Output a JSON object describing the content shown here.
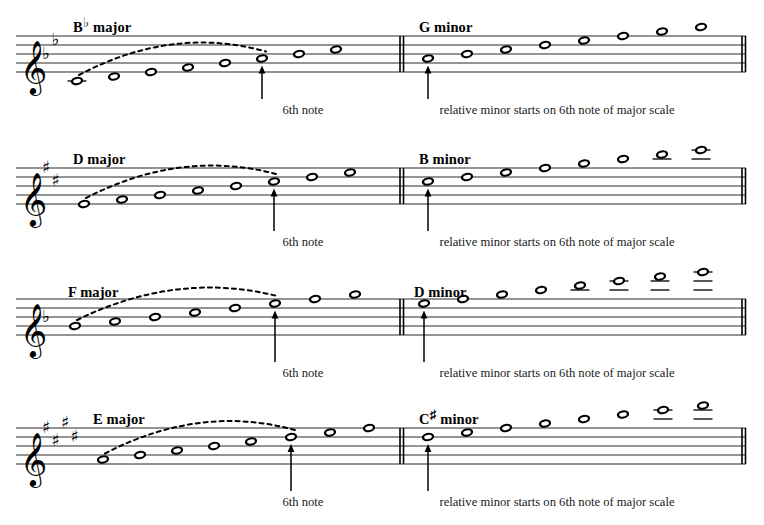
{
  "document": {
    "title": "Relative minor scales derived from major scales",
    "clef": "treble-clef",
    "note_head_type": "whole-note",
    "colors": {
      "ink": "#000000",
      "staff_line": "#2b2b2b",
      "slur": "#000000",
      "text": "#000000"
    }
  },
  "systems": [
    {
      "id": "system-1",
      "staff_top": 36,
      "major": {
        "label_text": "B",
        "label_accidental": "♭",
        "label_suffix": " major",
        "label_x": 73,
        "label_y": 20,
        "key_signature": {
          "type": "flat",
          "count": 2,
          "glyphs": [
            "♭",
            "♭"
          ]
        },
        "arrow_label": "6th note",
        "arrow_label_x": 303,
        "arrow_note_index": 5,
        "slur_from_index": 0,
        "slur_to_index": 5,
        "notes": [
          {
            "step": "B♭",
            "x": 77,
            "staff_pos": -2,
            "ledger": true
          },
          {
            "step": "C",
            "x": 114,
            "staff_pos": -1,
            "ledger": false
          },
          {
            "step": "D",
            "x": 151,
            "staff_pos": 0,
            "ledger": false
          },
          {
            "step": "E♭",
            "x": 188,
            "staff_pos": 1,
            "ledger": false
          },
          {
            "step": "F",
            "x": 225,
            "staff_pos": 2,
            "ledger": false
          },
          {
            "step": "G",
            "x": 262,
            "staff_pos": 3,
            "ledger": false
          },
          {
            "step": "A",
            "x": 299,
            "staff_pos": 4,
            "ledger": false
          },
          {
            "step": "B♭",
            "x": 336,
            "staff_pos": 5,
            "ledger": false
          }
        ]
      },
      "minor": {
        "label_text": "G",
        "label_accidental": "",
        "label_suffix": " minor",
        "label_x": 419,
        "label_y": 20,
        "key_signature": {
          "type": "none",
          "count": 0,
          "glyphs": []
        },
        "arrow_label": "relative minor starts on 6th note of major scale",
        "arrow_label_x": 557,
        "arrow_note_index": 0,
        "barline_x": 400,
        "end_barline_x": 742,
        "notes": [
          {
            "step": "G",
            "x": 428,
            "staff_pos": 3,
            "ledger": false
          },
          {
            "step": "A",
            "x": 467,
            "staff_pos": 4,
            "ledger": false
          },
          {
            "step": "B♭",
            "x": 506,
            "staff_pos": 5,
            "ledger": false
          },
          {
            "step": "C",
            "x": 545,
            "staff_pos": 6,
            "ledger": false
          },
          {
            "step": "D",
            "x": 584,
            "staff_pos": 7,
            "ledger": false
          },
          {
            "step": "E♭",
            "x": 623,
            "staff_pos": 8,
            "ledger": false
          },
          {
            "step": "F",
            "x": 662,
            "staff_pos": 9,
            "ledger": false
          },
          {
            "step": "G",
            "x": 701,
            "staff_pos": 10,
            "ledger": false
          }
        ]
      }
    },
    {
      "id": "system-2",
      "staff_top": 168,
      "major": {
        "label_text": "D",
        "label_accidental": "",
        "label_suffix": " major",
        "label_x": 73,
        "label_y": 152,
        "key_signature": {
          "type": "sharp",
          "count": 2,
          "glyphs": [
            "♯",
            "♯"
          ]
        },
        "arrow_label": "6th note",
        "arrow_label_x": 303,
        "arrow_note_index": 5,
        "slur_from_index": 0,
        "slur_to_index": 5,
        "notes": [
          {
            "step": "D",
            "x": 84,
            "staff_pos": 0,
            "ledger": false
          },
          {
            "step": "E",
            "x": 122,
            "staff_pos": 1,
            "ledger": false
          },
          {
            "step": "F♯",
            "x": 160,
            "staff_pos": 2,
            "ledger": false
          },
          {
            "step": "G",
            "x": 198,
            "staff_pos": 3,
            "ledger": false
          },
          {
            "step": "A",
            "x": 236,
            "staff_pos": 4,
            "ledger": false
          },
          {
            "step": "B",
            "x": 274,
            "staff_pos": 5,
            "ledger": false
          },
          {
            "step": "C♯",
            "x": 312,
            "staff_pos": 6,
            "ledger": false
          },
          {
            "step": "D",
            "x": 350,
            "staff_pos": 7,
            "ledger": false
          }
        ]
      },
      "minor": {
        "label_text": "B",
        "label_accidental": "",
        "label_suffix": " minor",
        "label_x": 419,
        "label_y": 152,
        "key_signature": {
          "type": "none",
          "count": 0,
          "glyphs": []
        },
        "arrow_label": "relative minor starts on 6th note of major scale",
        "arrow_label_x": 557,
        "arrow_note_index": 0,
        "barline_x": 400,
        "end_barline_x": 742,
        "notes": [
          {
            "step": "B",
            "x": 428,
            "staff_pos": 5,
            "ledger": false
          },
          {
            "step": "C♯",
            "x": 467,
            "staff_pos": 6,
            "ledger": false
          },
          {
            "step": "D",
            "x": 506,
            "staff_pos": 7,
            "ledger": false
          },
          {
            "step": "E",
            "x": 545,
            "staff_pos": 8,
            "ledger": false
          },
          {
            "step": "F♯",
            "x": 584,
            "staff_pos": 9,
            "ledger": false
          },
          {
            "step": "G",
            "x": 623,
            "staff_pos": 10,
            "ledger": false
          },
          {
            "step": "A",
            "x": 662,
            "staff_pos": 11,
            "ledger": true
          },
          {
            "step": "B",
            "x": 701,
            "staff_pos": 12,
            "ledger": true
          }
        ]
      }
    },
    {
      "id": "system-3",
      "staff_top": 299,
      "major": {
        "label_text": "F",
        "label_accidental": "",
        "label_suffix": " major",
        "label_x": 68,
        "label_y": 285,
        "key_signature": {
          "type": "flat",
          "count": 1,
          "glyphs": [
            "♭"
          ]
        },
        "arrow_label": "6th note",
        "arrow_label_x": 303,
        "arrow_note_index": 5,
        "slur_from_index": 0,
        "slur_to_index": 5,
        "notes": [
          {
            "step": "F",
            "x": 75,
            "staff_pos": 2,
            "ledger": false
          },
          {
            "step": "G",
            "x": 115,
            "staff_pos": 3,
            "ledger": false
          },
          {
            "step": "A",
            "x": 155,
            "staff_pos": 4,
            "ledger": false
          },
          {
            "step": "B♭",
            "x": 195,
            "staff_pos": 5,
            "ledger": false
          },
          {
            "step": "C",
            "x": 235,
            "staff_pos": 6,
            "ledger": false
          },
          {
            "step": "D",
            "x": 275,
            "staff_pos": 7,
            "ledger": false
          },
          {
            "step": "E",
            "x": 315,
            "staff_pos": 8,
            "ledger": false
          },
          {
            "step": "F",
            "x": 355,
            "staff_pos": 9,
            "ledger": false
          }
        ]
      },
      "minor": {
        "label_text": "D",
        "label_accidental": "",
        "label_suffix": " minor",
        "label_x": 414,
        "label_y": 285,
        "key_signature": {
          "type": "none",
          "count": 0,
          "glyphs": []
        },
        "arrow_label": "relative minor starts on 6th note of major scale",
        "arrow_label_x": 557,
        "arrow_note_index": 0,
        "barline_x": 400,
        "end_barline_x": 742,
        "notes": [
          {
            "step": "D",
            "x": 424,
            "staff_pos": 7,
            "ledger": false
          },
          {
            "step": "E",
            "x": 463,
            "staff_pos": 8,
            "ledger": false
          },
          {
            "step": "F",
            "x": 502,
            "staff_pos": 9,
            "ledger": false
          },
          {
            "step": "G",
            "x": 541,
            "staff_pos": 10,
            "ledger": false
          },
          {
            "step": "A",
            "x": 580,
            "staff_pos": 11,
            "ledger": true
          },
          {
            "step": "B♭",
            "x": 619,
            "staff_pos": 12,
            "ledger": true
          },
          {
            "step": "C",
            "x": 660,
            "staff_pos": 13,
            "ledger": true
          },
          {
            "step": "D",
            "x": 703,
            "staff_pos": 14,
            "ledger": true
          }
        ]
      }
    },
    {
      "id": "system-4",
      "staff_top": 428,
      "major": {
        "label_text": "E",
        "label_accidental": "",
        "label_suffix": " major",
        "label_x": 93,
        "label_y": 412,
        "key_signature": {
          "type": "sharp",
          "count": 4,
          "glyphs": [
            "♯",
            "♯",
            "♯",
            "♯"
          ]
        },
        "arrow_label": "6th note",
        "arrow_label_x": 303,
        "arrow_note_index": 5,
        "slur_from_index": 0,
        "slur_to_index": 5,
        "notes": [
          {
            "step": "E",
            "x": 103,
            "staff_pos": 1,
            "ledger": false
          },
          {
            "step": "F♯",
            "x": 140,
            "staff_pos": 2,
            "ledger": false
          },
          {
            "step": "G♯",
            "x": 177,
            "staff_pos": 3,
            "ledger": false
          },
          {
            "step": "A",
            "x": 214,
            "staff_pos": 4,
            "ledger": false
          },
          {
            "step": "B",
            "x": 251,
            "staff_pos": 5,
            "ledger": false
          },
          {
            "step": "C♯",
            "x": 291,
            "staff_pos": 6,
            "ledger": false
          },
          {
            "step": "D♯",
            "x": 330,
            "staff_pos": 7,
            "ledger": false
          },
          {
            "step": "E",
            "x": 369,
            "staff_pos": 8,
            "ledger": false
          }
        ]
      },
      "minor": {
        "label_text": "C",
        "label_accidental": "♯",
        "label_suffix": " minor",
        "label_x": 419,
        "label_y": 412,
        "key_signature": {
          "type": "none",
          "count": 0,
          "glyphs": []
        },
        "arrow_label": "relative minor starts on 6th note of major scale",
        "arrow_label_x": 557,
        "arrow_note_index": 0,
        "barline_x": 400,
        "end_barline_x": 742,
        "notes": [
          {
            "step": "C♯",
            "x": 428,
            "staff_pos": 6,
            "ledger": false
          },
          {
            "step": "D♯",
            "x": 467,
            "staff_pos": 7,
            "ledger": false
          },
          {
            "step": "E",
            "x": 506,
            "staff_pos": 8,
            "ledger": false
          },
          {
            "step": "F♯",
            "x": 545,
            "staff_pos": 9,
            "ledger": false
          },
          {
            "step": "G♯",
            "x": 584,
            "staff_pos": 10,
            "ledger": false
          },
          {
            "step": "A",
            "x": 623,
            "staff_pos": 11,
            "ledger": false
          },
          {
            "step": "B",
            "x": 663,
            "staff_pos": 12,
            "ledger": true
          },
          {
            "step": "C♯",
            "x": 703,
            "staff_pos": 13,
            "ledger": true
          }
        ]
      }
    }
  ]
}
